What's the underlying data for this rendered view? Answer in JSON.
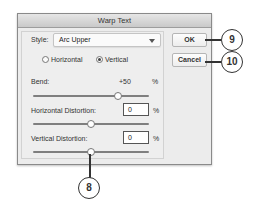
{
  "dialog": {
    "title": "Warp Text",
    "style_label": "Style:",
    "style_value": "Arc Upper",
    "orientation": {
      "horizontal_label": "Horizontal",
      "vertical_label": "Vertical",
      "selected": "Vertical"
    },
    "bend": {
      "label": "Bend:",
      "value": "+50",
      "unit": "%"
    },
    "horizontal_distortion": {
      "label": "Horizontal Distortion:",
      "value": "0",
      "unit": "%"
    },
    "vertical_distortion": {
      "label": "Vertical Distortion:",
      "value": "0",
      "unit": "%"
    },
    "buttons": {
      "ok": "OK",
      "cancel": "Cancel"
    }
  },
  "callouts": {
    "ok": "9",
    "cancel": "10",
    "vertical_slider": "8"
  }
}
